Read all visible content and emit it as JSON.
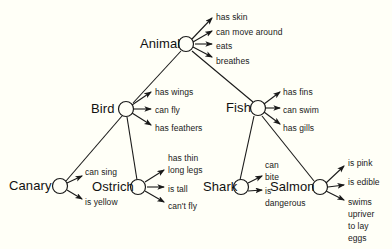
{
  "diagram": {
    "type": "semantic-network",
    "background_color": "#fffff7",
    "line_color": "#1a1a1a",
    "nodes": [
      {
        "id": "animal",
        "label": "Animal",
        "cx": 186,
        "cy": 44,
        "r": 7.5,
        "label_x": 140,
        "label_y": 37
      },
      {
        "id": "bird",
        "label": "Bird",
        "cx": 126,
        "cy": 109,
        "r": 7.5,
        "label_x": 91,
        "label_y": 102
      },
      {
        "id": "fish",
        "label": "Fish",
        "cx": 258,
        "cy": 108,
        "r": 7.5,
        "label_x": 226,
        "label_y": 101
      },
      {
        "id": "canary",
        "label": "Canary",
        "cx": 60,
        "cy": 186,
        "r": 7.5,
        "label_x": 9,
        "label_y": 179
      },
      {
        "id": "ostrich",
        "label": "Ostrich",
        "cx": 138,
        "cy": 187,
        "r": 7.5,
        "label_x": 92,
        "label_y": 180
      },
      {
        "id": "shark",
        "label": "Shark",
        "cx": 241,
        "cy": 187,
        "r": 7.5,
        "label_x": 203,
        "label_y": 180
      },
      {
        "id": "salmon",
        "label": "Salmon",
        "cx": 320,
        "cy": 187,
        "r": 7.5,
        "label_x": 270,
        "label_y": 180
      }
    ],
    "isa_links": [
      {
        "id": "bird-animal",
        "from": "bird",
        "to": "animal",
        "x1": 133,
        "y1": 103,
        "x2": 181,
        "y2": 51
      },
      {
        "id": "fish-animal",
        "from": "fish",
        "to": "animal",
        "x1": 253,
        "y1": 102,
        "x2": 192,
        "y2": 51
      },
      {
        "id": "canary-bird",
        "from": "canary",
        "to": "bird",
        "x1": 66,
        "y1": 181,
        "x2": 122,
        "y2": 116
      },
      {
        "id": "ostrich-bird",
        "from": "ostrich",
        "to": "bird",
        "x1": 137,
        "y1": 180,
        "x2": 127,
        "y2": 117
      },
      {
        "id": "shark-fish",
        "from": "shark",
        "to": "fish",
        "x1": 240,
        "y1": 180,
        "x2": 254,
        "y2": 116
      },
      {
        "id": "salmon-fish",
        "from": "salmon",
        "to": "fish",
        "x1": 314,
        "y1": 181,
        "x2": 262,
        "y2": 116
      }
    ],
    "property_groups": [
      {
        "node": "animal",
        "properties": [
          {
            "text": "has skin",
            "label_x": 216,
            "label_y": 12,
            "x1": 192,
            "y1": 39,
            "x2": 212,
            "y2": 18
          },
          {
            "text": "can move around",
            "label_x": 216,
            "label_y": 27,
            "x1": 193,
            "y1": 42,
            "x2": 212,
            "y2": 31
          },
          {
            "text": "eats",
            "label_x": 216,
            "label_y": 41,
            "x1": 195,
            "y1": 44,
            "x2": 212,
            "y2": 44
          },
          {
            "text": "breathes",
            "label_x": 216,
            "label_y": 56,
            "x1": 193,
            "y1": 47,
            "x2": 212,
            "y2": 57
          }
        ]
      },
      {
        "node": "bird",
        "properties": [
          {
            "text": "has wings",
            "label_x": 155,
            "label_y": 87,
            "x1": 132,
            "y1": 105,
            "x2": 151,
            "y2": 92
          },
          {
            "text": "can fly",
            "label_x": 155,
            "label_y": 105,
            "x1": 134,
            "y1": 109,
            "x2": 151,
            "y2": 109
          },
          {
            "text": "has feathers",
            "label_x": 155,
            "label_y": 123,
            "x1": 132,
            "y1": 113,
            "x2": 151,
            "y2": 125
          }
        ]
      },
      {
        "node": "fish",
        "properties": [
          {
            "text": "has fins",
            "label_x": 283,
            "label_y": 87,
            "x1": 264,
            "y1": 104,
            "x2": 280,
            "y2": 92
          },
          {
            "text": "can swim",
            "label_x": 283,
            "label_y": 105,
            "x1": 266,
            "y1": 108,
            "x2": 280,
            "y2": 108
          },
          {
            "text": "has gills",
            "label_x": 283,
            "label_y": 123,
            "x1": 264,
            "y1": 112,
            "x2": 280,
            "y2": 124
          }
        ]
      },
      {
        "node": "canary",
        "properties": [
          {
            "text": "can sing",
            "label_x": 85,
            "label_y": 167,
            "x1": 67,
            "y1": 183,
            "x2": 82,
            "y2": 176
          },
          {
            "text": "is yellow",
            "label_x": 85,
            "label_y": 197,
            "x1": 67,
            "y1": 190,
            "x2": 82,
            "y2": 199
          }
        ]
      },
      {
        "node": "ostrich",
        "properties": [
          {
            "text": "has thin",
            "label_x": 168,
            "label_y": 153,
            "x1": 0,
            "y1": 0,
            "x2": 0,
            "y2": 0,
            "no_arrow": true
          },
          {
            "text": "long legs",
            "label_x": 168,
            "label_y": 165,
            "x1": 145,
            "y1": 182,
            "x2": 164,
            "y2": 170
          },
          {
            "text": "is tall",
            "label_x": 168,
            "label_y": 184,
            "x1": 147,
            "y1": 187,
            "x2": 164,
            "y2": 187
          },
          {
            "text": "can't fly",
            "label_x": 168,
            "label_y": 201,
            "x1": 145,
            "y1": 191,
            "x2": 164,
            "y2": 202
          }
        ]
      },
      {
        "node": "shark",
        "properties": [
          {
            "text": "can",
            "label_x": 265,
            "label_y": 160,
            "x1": 0,
            "y1": 0,
            "x2": 0,
            "y2": 0,
            "no_arrow": true
          },
          {
            "text": "bite",
            "label_x": 265,
            "label_y": 172,
            "x1": 248,
            "y1": 183,
            "x2": 262,
            "y2": 176
          },
          {
            "text": "is",
            "label_x": 265,
            "label_y": 186,
            "x1": 248,
            "y1": 191,
            "x2": 262,
            "y2": 190
          },
          {
            "text": "dangerous",
            "label_x": 265,
            "label_y": 198,
            "x1": 0,
            "y1": 0,
            "x2": 0,
            "y2": 0,
            "no_arrow": true
          }
        ]
      },
      {
        "node": "salmon",
        "properties": [
          {
            "text": "is pink",
            "label_x": 348,
            "label_y": 158,
            "x1": 326,
            "y1": 183,
            "x2": 344,
            "y2": 166
          },
          {
            "text": "is edible",
            "label_x": 348,
            "label_y": 177,
            "x1": 328,
            "y1": 187,
            "x2": 344,
            "y2": 185
          },
          {
            "text": "swims",
            "label_x": 348,
            "label_y": 197,
            "x1": 326,
            "y1": 191,
            "x2": 344,
            "y2": 200
          },
          {
            "text": "upriver",
            "label_x": 348,
            "label_y": 209,
            "x1": 0,
            "y1": 0,
            "x2": 0,
            "y2": 0,
            "no_arrow": true
          },
          {
            "text": "to lay",
            "label_x": 348,
            "label_y": 221,
            "x1": 0,
            "y1": 0,
            "x2": 0,
            "y2": 0,
            "no_arrow": true
          },
          {
            "text": "eggs",
            "label_x": 348,
            "label_y": 233,
            "x1": 0,
            "y1": 0,
            "x2": 0,
            "y2": 0,
            "no_arrow": true
          }
        ]
      }
    ]
  }
}
